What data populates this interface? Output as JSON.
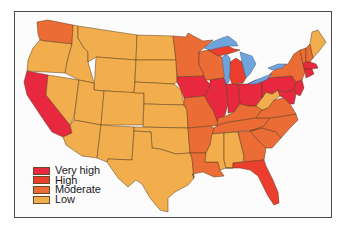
{
  "map": {
    "title": "",
    "region": "Contiguous United States",
    "colors": {
      "very_high": "#e8283e",
      "high": "#ec3e2c",
      "moderate": "#ec6c36",
      "low": "#f2ae4c",
      "lakes": "#6fa3dc"
    },
    "states": {
      "WA": "moderate",
      "OR": "low",
      "CA": "very_high",
      "NV": "low",
      "ID": "low",
      "MT": "low",
      "WY": "low",
      "UT": "low",
      "AZ": "low",
      "CO": "low",
      "NM": "low",
      "ND": "low",
      "SD": "low",
      "NE": "low",
      "KS": "low",
      "OK": "low",
      "TX": "low",
      "MN": "moderate",
      "IA": "very_high",
      "MO": "moderate",
      "AR": "moderate",
      "LA": "moderate",
      "WI": "moderate",
      "IL": "very_high",
      "MI": "high",
      "IN": "very_high",
      "OH": "very_high",
      "KY": "moderate",
      "TN": "moderate",
      "MS": "low",
      "AL": "low",
      "GA": "moderate",
      "FL": "high",
      "SC": "moderate",
      "NC": "moderate",
      "VA": "moderate",
      "WV": "low",
      "PA": "very_high",
      "NY": "moderate",
      "VT": "moderate",
      "NH": "moderate",
      "ME": "low",
      "MA": "very_high",
      "CT": "very_high",
      "RI": "very_high",
      "NJ": "very_high",
      "DE": "very_high",
      "MD": "very_high"
    }
  },
  "legend": {
    "items": [
      {
        "label": "Very high",
        "color": "#e8283e"
      },
      {
        "label": "High",
        "color": "#ec3e2c"
      },
      {
        "label": "Moderate",
        "color": "#ec6c36"
      },
      {
        "label": "Low",
        "color": "#f2ae4c"
      }
    ]
  }
}
